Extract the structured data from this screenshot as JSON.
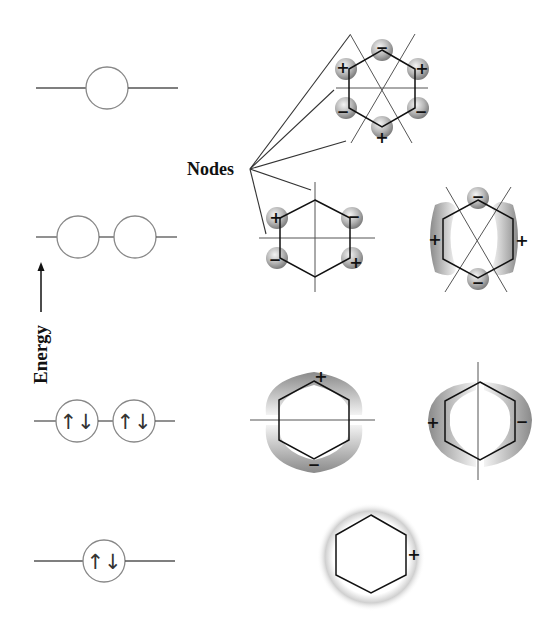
{
  "labels": {
    "energy": "Energy",
    "nodes": "Nodes"
  },
  "signs": {
    "plus": "+",
    "minus": "−"
  },
  "spin_pair": "↑↓",
  "energy_levels": [
    {
      "level": 1,
      "name": "psi6-antibonding",
      "orbitals": 1,
      "electrons": 0,
      "node_count": 3
    },
    {
      "level": 2,
      "name": "psi4-psi5-degenerate-antibonding",
      "orbitals": 2,
      "electrons": 0,
      "node_count": 2
    },
    {
      "level": 3,
      "name": "psi2-psi3-degenerate-bonding",
      "orbitals": 2,
      "electrons": 4,
      "occupancy": [
        "↑↓",
        "↑↓"
      ],
      "node_count": 1
    },
    {
      "level": 4,
      "name": "psi1-bonding",
      "orbitals": 1,
      "electrons": 2,
      "occupancy": [
        "↑↓"
      ],
      "node_count": 0
    }
  ],
  "orbitals": [
    {
      "id": "psi6",
      "lobe_signs": [
        "−",
        "+",
        "−",
        "+",
        "−",
        "+"
      ]
    },
    {
      "id": "psi5",
      "lobe_signs": [
        "+",
        "−",
        "−",
        "+"
      ]
    },
    {
      "id": "psi4",
      "lobe_signs": [
        "−",
        "+",
        "−",
        "+"
      ]
    },
    {
      "id": "psi3",
      "lobe_signs": [
        "+",
        "−"
      ]
    },
    {
      "id": "psi2",
      "lobe_signs": [
        "+",
        "−"
      ]
    },
    {
      "id": "psi1",
      "lobe_signs": [
        "+"
      ]
    }
  ],
  "colors": {
    "line": "#222222",
    "level_line": "#555555",
    "lobe_dark": "#7a7a7a",
    "lobe_light": "#f2f2f2",
    "background": "#ffffff"
  }
}
